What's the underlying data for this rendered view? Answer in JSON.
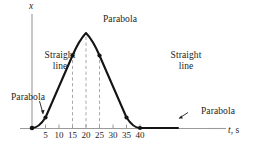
{
  "figure": {
    "background_color": "#ffffff",
    "curve_color": "#141414",
    "axis_color": "#9a9a9a",
    "dash_color": "#a8a8a8",
    "text_color": "#1d1d1d"
  },
  "axes": {
    "x_axis_label": "t, s",
    "x_axis_label_symbol": "t",
    "x_axis_label_unit": "s",
    "y_axis_label": "x",
    "x_ticks": [
      5,
      10,
      15,
      20,
      25,
      30,
      35,
      40
    ],
    "x_tick_labels": [
      "5",
      "10",
      "15",
      "20",
      "25",
      "30",
      "35",
      "40"
    ],
    "x_range": [
      0,
      46
    ],
    "y_range": [
      0,
      1.18
    ]
  },
  "annotations": [
    {
      "name": "parabola-top",
      "text": "Parabola"
    },
    {
      "name": "straight-line-left",
      "text": "Straight\nline"
    },
    {
      "name": "straight-line-right",
      "text": "Straight\nline"
    },
    {
      "name": "parabola-left",
      "text": "Parabola"
    },
    {
      "name": "parabola-right",
      "text": "Parabola"
    }
  ],
  "chart_data": {
    "type": "line",
    "title": "",
    "xlabel": "t, s",
    "ylabel": "x",
    "xlim": [
      0,
      46
    ],
    "ylim": [
      0,
      1.18
    ],
    "grid": false,
    "legend": null,
    "segments": [
      {
        "name": "parabola-start",
        "shape": "parabola",
        "t_range": [
          0,
          5
        ],
        "description": "Parabola rising from rest at origin"
      },
      {
        "name": "straight-line-up",
        "shape": "straight line",
        "t_range": [
          5,
          15
        ],
        "description": "Constant positive slope"
      },
      {
        "name": "parabola-peak",
        "shape": "parabola",
        "t_range": [
          15,
          25
        ],
        "description": "Parabolic crest, maximum at t = 20"
      },
      {
        "name": "straight-line-down",
        "shape": "straight line",
        "t_range": [
          25,
          35
        ],
        "description": "Constant negative slope"
      },
      {
        "name": "parabola-end",
        "shape": "parabola",
        "t_range": [
          35,
          40
        ],
        "description": "Parabola flattening to rest"
      },
      {
        "name": "flat-end",
        "shape": "straight line",
        "t_range": [
          40,
          46
        ],
        "description": "Constant value after t = 40"
      }
    ],
    "knot_points": [
      {
        "t": 0,
        "x": 0.0
      },
      {
        "t": 5,
        "x": 0.105
      },
      {
        "t": 15,
        "x": 0.79
      },
      {
        "t": 20,
        "x": 1.0
      },
      {
        "t": 25,
        "x": 0.79
      },
      {
        "t": 35,
        "x": 0.105
      },
      {
        "t": 40,
        "x": 0.0
      }
    ],
    "marker_points": [
      {
        "t": 0,
        "x": 0.0
      },
      {
        "t": 5,
        "x": 0.105
      },
      {
        "t": 15,
        "x": 0.79
      },
      {
        "t": 25,
        "x": 0.79
      },
      {
        "t": 35,
        "x": 0.105
      },
      {
        "t": 40,
        "x": 0.0
      }
    ],
    "dashed_guide_lines": [
      {
        "t": 15,
        "x_top": 0.79
      },
      {
        "t": 20,
        "x_top": 1.0
      },
      {
        "t": 25,
        "x_top": 0.79
      }
    ]
  }
}
